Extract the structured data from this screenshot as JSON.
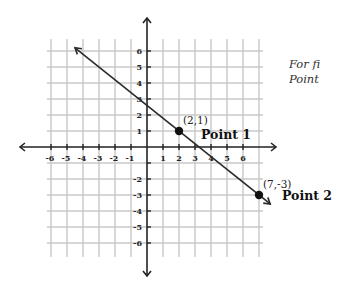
{
  "chart_data": {
    "type": "line",
    "title": "",
    "xlabel": "",
    "ylabel": "",
    "xlim": [
      -6.5,
      7.5
    ],
    "ylim": [
      -6.5,
      6.5
    ],
    "grid": true,
    "x_tick_labels": [
      "-6",
      "-5",
      "-4",
      "-3",
      "-2",
      "-1",
      "1",
      "2",
      "3",
      "4",
      "5",
      "6"
    ],
    "y_tick_labels": [
      "6",
      "5",
      "4",
      "3",
      "2",
      "1",
      "-2",
      "-3",
      "-4",
      "-5",
      "-6"
    ],
    "x_ticks": [
      -6,
      -5,
      -4,
      -3,
      -2,
      -1,
      1,
      2,
      3,
      4,
      5,
      6
    ],
    "y_ticks": [
      6,
      5,
      4,
      3,
      2,
      1,
      -2,
      -3,
      -4,
      -5,
      -6
    ],
    "series": [
      {
        "name": "line through Point 1 and Point 2",
        "x": [
          -4.5,
          2,
          7,
          7.7
        ],
        "y": [
          6.2,
          1,
          -3,
          -3.56
        ],
        "slope": -0.8,
        "y_intercept": 2.6,
        "arrows": "both"
      }
    ],
    "points": [
      {
        "name": "Point 1",
        "coord_label": "(2,1)",
        "x": 2,
        "y": 1
      },
      {
        "name": "Point 2",
        "coord_label": "(7,-3)",
        "x": 7,
        "y": -3
      }
    ]
  },
  "side_text": {
    "line1": "For fi",
    "line2": "Point"
  },
  "colors": {
    "grid": "#c8c8c8",
    "axis": "#222222",
    "line": "#2a2a2a",
    "point": "#111111"
  }
}
